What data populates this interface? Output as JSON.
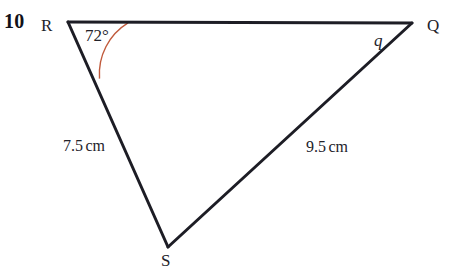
{
  "question": {
    "number": "10"
  },
  "figure": {
    "type": "triangle",
    "vertices": [
      {
        "name": "R",
        "label": "R",
        "x": 68,
        "y": 22,
        "label_x": 41,
        "label_y": 17
      },
      {
        "name": "Q",
        "label": "Q",
        "x": 412,
        "y": 23,
        "label_x": 427,
        "label_y": 17
      },
      {
        "name": "S",
        "label": "S",
        "x": 168,
        "y": 247,
        "label_x": 161,
        "label_y": 252
      }
    ],
    "sides": [
      {
        "name": "RQ",
        "from": "R",
        "to": "Q",
        "label": "q",
        "label_style": "italic",
        "label_x": 374,
        "label_y": 32
      },
      {
        "name": "RS",
        "from": "R",
        "to": "S",
        "label": "7.5 cm",
        "value": 7.5,
        "unit": "cm",
        "label_x": 63,
        "label_y": 138
      },
      {
        "name": "QS",
        "from": "Q",
        "to": "S",
        "label": "9.5 cm",
        "value": 9.5,
        "unit": "cm",
        "label_x": 306,
        "label_y": 139
      }
    ],
    "angles": [
      {
        "at": "R",
        "label": "72°",
        "value": 72,
        "unit": "degrees",
        "arc_color": "#c05a3c",
        "arc_radius": 60,
        "label_x": 85,
        "label_y": 27
      }
    ],
    "line_color": "#1d1d25",
    "line_width": 3,
    "background": "#ffffff"
  },
  "labels": {
    "side_rs_number": "7.5",
    "side_rs_unit": "cm",
    "side_qs_number": "9.5",
    "side_qs_unit": "cm",
    "side_q_letter": "q",
    "angle_text": "72°"
  }
}
